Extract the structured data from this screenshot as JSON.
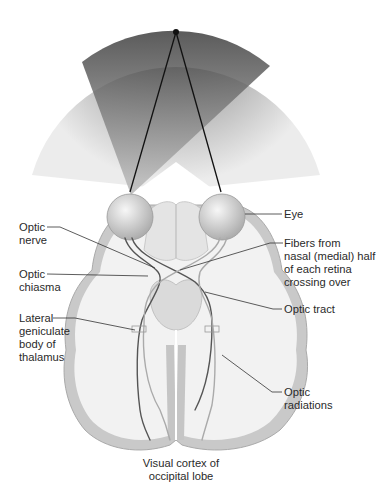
{
  "diagram": {
    "labels": {
      "left": [
        {
          "id": "optic-nerve",
          "lines": [
            "Optic",
            "nerve"
          ]
        },
        {
          "id": "optic-chiasma",
          "lines": [
            "Optic",
            "chiasma"
          ]
        },
        {
          "id": "lateral-geniculate",
          "lines": [
            "Lateral",
            "geniculate",
            "body of",
            "thalamus"
          ]
        }
      ],
      "right": [
        {
          "id": "eye",
          "lines": [
            "Eye"
          ]
        },
        {
          "id": "fibers-crossing",
          "lines": [
            "Fibers from",
            "nasal (medial) half",
            "of each retina",
            "crossing over"
          ]
        },
        {
          "id": "optic-tract",
          "lines": [
            "Optic tract"
          ]
        },
        {
          "id": "optic-radiations",
          "lines": [
            "Optic",
            "radiations"
          ]
        }
      ],
      "bottom": {
        "id": "visual-cortex",
        "lines": [
          "Visual cortex of",
          "occipital lobe"
        ]
      }
    },
    "colors": {
      "field_dark": "#4a4a4a",
      "field_light": "#e6e6e6",
      "brain_fill": "#ededed",
      "cortex_gray": "#c9c9c9",
      "line": "#222222"
    }
  }
}
